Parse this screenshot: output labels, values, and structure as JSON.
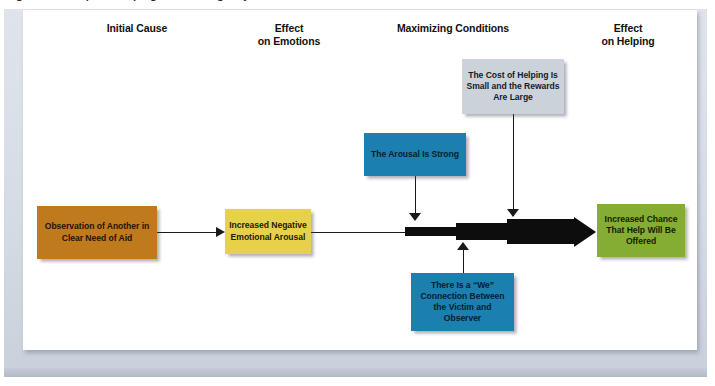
{
  "figure": {
    "caption": "Figure 12.7  Steps to Helping in an Emergency"
  },
  "headers": [
    {
      "id": "initial-cause",
      "lines": [
        "Initial Cause"
      ]
    },
    {
      "id": "effect-on-emotions",
      "lines": [
        "Effect",
        "on Emotions"
      ]
    },
    {
      "id": "maximizing-conditions",
      "lines": [
        "Maximizing Conditions"
      ]
    },
    {
      "id": "effect-on-helping",
      "lines": [
        "Effect",
        "on Helping"
      ]
    }
  ],
  "nodes": {
    "initial_cause": {
      "text": "Observation of Another in Clear Need of Aid",
      "color": "#c07a1e"
    },
    "emotion": {
      "text": "Increased Negative Emotional Arousal",
      "color": "#e8d14a"
    },
    "arousal_strong": {
      "text": "The Arousal Is Strong",
      "color": "#1b7fb0"
    },
    "cost_reward": {
      "text": "The Cost of Helping Is Small and the Rewards Are Large",
      "color": "#ccd2da"
    },
    "we_connection": {
      "text": "There Is a “We” Connection Between the Victim and Observer",
      "color": "#1b7fb0"
    },
    "outcome": {
      "text": "Increased Chance That Help Will Be Offered",
      "color": "#86ad33"
    }
  },
  "palette": {
    "connector": "#1a1a1a",
    "panel_background": "#ffffff",
    "frame_background": "#d6dce6"
  }
}
